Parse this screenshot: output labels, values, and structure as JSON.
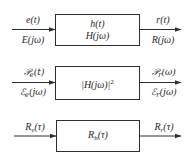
{
  "diagram": {
    "rows": [
      {
        "name": "time-frequency-system",
        "input_top": "e(t)",
        "input_bottom": "E(jω)",
        "block_line1": "h(t)",
        "block_line2": "H(jω)",
        "output_top": "r(t)",
        "output_bottom": "R(jω)"
      },
      {
        "name": "power-energy-spectrum-system",
        "input_top_base": "𝒫",
        "input_top_sub": "e",
        "input_top_arg": "(t)",
        "input_bottom_base": "ℰ",
        "input_bottom_sub": "e",
        "input_bottom_arg": "(jω)",
        "block_line1_base": "|H(jω)|",
        "block_line1_sup": "2",
        "output_top_base": "𝒫",
        "output_top_sub": "r",
        "output_top_arg": "(ω)",
        "output_bottom_base": "ℰ",
        "output_bottom_sub": "r",
        "output_bottom_arg": "(jω)"
      },
      {
        "name": "autocorrelation-system",
        "input_top_base": "R",
        "input_top_sub": "e",
        "input_top_arg": "(τ)",
        "block_line1_base": "R",
        "block_line1_sub": "h",
        "block_line1_arg": "(τ)",
        "output_top_base": "R",
        "output_top_sub": "r",
        "output_top_arg": "(τ)"
      }
    ],
    "colors": {
      "line": "#2e2e2e",
      "text": "#2a2a2a",
      "background": "#ffffff"
    }
  }
}
